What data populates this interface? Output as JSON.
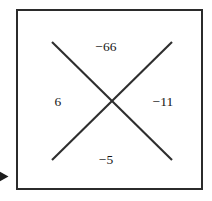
{
  "figure": {
    "type": "diamond-problem",
    "values": {
      "top": "−66",
      "left": "6",
      "right": "−11",
      "bottom": "−5"
    },
    "colors": {
      "background": "#ffffff",
      "border": "#2b2b2b",
      "stroke": "#2e2e2e",
      "text": "#161616"
    },
    "marker": {
      "name": "arrow-right",
      "glyph": "▶"
    }
  }
}
